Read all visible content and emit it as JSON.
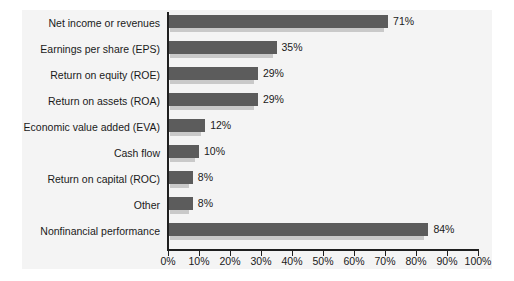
{
  "chart_data": {
    "type": "bar",
    "orientation": "horizontal",
    "title": "",
    "xlabel": "",
    "ylabel": "",
    "xlim": [
      0,
      100
    ],
    "grid": false,
    "legend": "none",
    "categories": [
      "Net income or revenues",
      "Earnings per share (EPS)",
      "Return on equity (ROE)",
      "Return on assets (ROA)",
      "Economic value added (EVA)",
      "Cash flow",
      "Return on capital (ROC)",
      "Other",
      "Nonfinancial performance"
    ],
    "values": [
      71,
      35,
      29,
      29,
      12,
      10,
      8,
      8,
      84
    ],
    "value_labels": [
      "71%",
      "35%",
      "29%",
      "29%",
      "12%",
      "10%",
      "8%",
      "8%",
      "84%"
    ],
    "xticks": [
      0,
      10,
      20,
      30,
      40,
      50,
      60,
      70,
      80,
      90,
      100
    ],
    "xtick_labels": [
      "0%",
      "10%",
      "20%",
      "30%",
      "40%",
      "50%",
      "60%",
      "70%",
      "80%",
      "90%",
      "100%"
    ],
    "colors": {
      "bar": "#5c5c5c",
      "bar_shadow": "#c9c9c9",
      "axis": "#1f1f1f",
      "panel_background": "#f4f4f4",
      "figure_background": "#ffffff",
      "text": "#1a1a1a"
    }
  }
}
